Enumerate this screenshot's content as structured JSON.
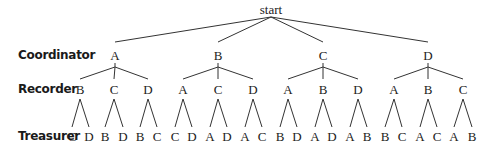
{
  "diagram": {
    "type": "tree",
    "root": {
      "label": "start",
      "x": 271,
      "y": 9
    },
    "levels": [
      {
        "label": "Coordinator",
        "y": 55
      },
      {
        "label": "Recorder",
        "y": 89
      },
      {
        "label": "Treasurer",
        "y": 136
      }
    ],
    "line_color": "#333333",
    "coordinators": [
      {
        "label": "A",
        "x": 115,
        "recorders": [
          {
            "label": "B",
            "x": 80,
            "treasurers": [
              {
                "label": "C",
                "x": 72
              },
              {
                "label": "D",
                "x": 89
              }
            ]
          },
          {
            "label": "C",
            "x": 114,
            "treasurers": [
              {
                "label": "B",
                "x": 105
              },
              {
                "label": "D",
                "x": 123
              }
            ]
          },
          {
            "label": "D",
            "x": 148,
            "treasurers": [
              {
                "label": "B",
                "x": 140
              },
              {
                "label": "C",
                "x": 157
              }
            ]
          }
        ]
      },
      {
        "label": "B",
        "x": 218,
        "recorders": [
          {
            "label": "A",
            "x": 183,
            "treasurers": [
              {
                "label": "C",
                "x": 175
              },
              {
                "label": "D",
                "x": 192
              }
            ]
          },
          {
            "label": "C",
            "x": 218,
            "treasurers": [
              {
                "label": "A",
                "x": 210
              },
              {
                "label": "D",
                "x": 227
              }
            ]
          },
          {
            "label": "D",
            "x": 253,
            "treasurers": [
              {
                "label": "A",
                "x": 245
              },
              {
                "label": "C",
                "x": 262
              }
            ]
          }
        ]
      },
      {
        "label": "C",
        "x": 323,
        "recorders": [
          {
            "label": "A",
            "x": 288,
            "treasurers": [
              {
                "label": "B",
                "x": 280
              },
              {
                "label": "D",
                "x": 297
              }
            ]
          },
          {
            "label": "B",
            "x": 323,
            "treasurers": [
              {
                "label": "A",
                "x": 315
              },
              {
                "label": "D",
                "x": 332
              }
            ]
          },
          {
            "label": "D",
            "x": 358,
            "treasurers": [
              {
                "label": "A",
                "x": 350
              },
              {
                "label": "B",
                "x": 367
              }
            ]
          }
        ]
      },
      {
        "label": "D",
        "x": 428,
        "recorders": [
          {
            "label": "A",
            "x": 394,
            "treasurers": [
              {
                "label": "B",
                "x": 385
              },
              {
                "label": "C",
                "x": 402
              }
            ]
          },
          {
            "label": "B",
            "x": 428,
            "treasurers": [
              {
                "label": "A",
                "x": 420
              },
              {
                "label": "C",
                "x": 437
              }
            ]
          },
          {
            "label": "C",
            "x": 463,
            "treasurers": [
              {
                "label": "A",
                "x": 454
              },
              {
                "label": "B",
                "x": 472
              }
            ]
          }
        ]
      }
    ]
  }
}
